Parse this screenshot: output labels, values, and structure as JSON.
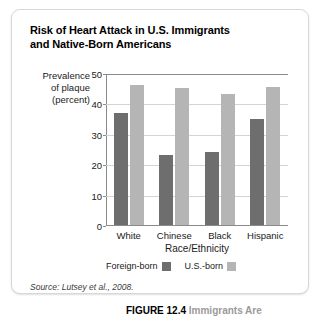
{
  "figure": {
    "title": "Risk of Heart Attack in U.S. Immigrants and Native-Born Americans",
    "title_line1": "Risk of Heart Attack in U.S. Immigrants",
    "title_line2": "and Native-Born Americans",
    "source_label": "Source:",
    "source_text": "Lutsey et al., 2008.",
    "source_full": "Source: Lutsey et al., 2008.",
    "caption_number": "FIGURE 12.4",
    "caption_text": "Immigrants Are"
  },
  "y_caption": {
    "line1": "Prevalence",
    "line2": "of plaque",
    "line3": "(percent)"
  },
  "colors": {
    "foreign_born": "#6e6e6e",
    "us_born": "#b5b5b5",
    "axis": "#8a8a8a",
    "gridline": "#d4d4d4",
    "card_border": "#d8d8d8",
    "caption_gray": "#9a9a9a"
  },
  "chart_data": {
    "type": "bar",
    "title": "Risk of Heart Attack in U.S. Immigrants and Native-Born Americans",
    "xlabel": "Race/Ethnicity",
    "ylabel": "Prevalence of plaque (percent)",
    "categories": [
      "White",
      "Chinese",
      "Black",
      "Hispanic"
    ],
    "series": [
      {
        "name": "Foreign-born",
        "color": "#6e6e6e",
        "values": [
          37,
          23,
          24,
          35
        ]
      },
      {
        "name": "U.S.-born",
        "color": "#b5b5b5",
        "values": [
          46,
          45,
          43,
          45.5
        ]
      }
    ],
    "ylim": [
      0,
      50
    ],
    "yticks": [
      0,
      10,
      20,
      30,
      40,
      50
    ],
    "ytick_labels": [
      "0",
      "10",
      "20",
      "30",
      "40",
      "50"
    ],
    "grid": true,
    "legend_position": "bottom"
  }
}
